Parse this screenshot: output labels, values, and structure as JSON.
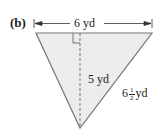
{
  "figure": {
    "part_label": "(b)",
    "shape": "triangle",
    "colors": {
      "fill": "#ececec",
      "stroke": "#777777",
      "text": "#222222"
    },
    "dimensions": {
      "base": {
        "value": "6 yd"
      },
      "height": {
        "value": "5 yd"
      },
      "side": {
        "whole": "6",
        "numerator": "1",
        "denominator": "2",
        "unit": "yd"
      }
    },
    "annotations": [
      "right-angle marker",
      "dashed altitude",
      "dimension arrows"
    ]
  }
}
